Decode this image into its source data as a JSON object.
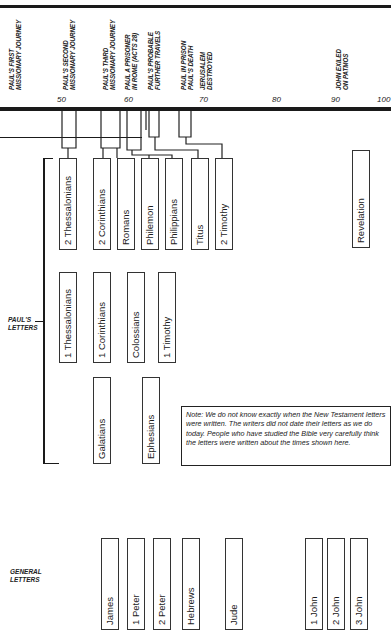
{
  "header": {
    "caption": ""
  },
  "timeline": {
    "ticks": [
      {
        "label": "50",
        "x": 62
      },
      {
        "label": "60",
        "x": 129
      },
      {
        "label": "70",
        "x": 204
      },
      {
        "label": "80",
        "x": 277
      },
      {
        "label": "90",
        "x": 336
      },
      {
        "label": "100",
        "x": 382
      }
    ],
    "events": [
      {
        "lines": [
          "PAUL'S FIRST",
          "MISSIONARY JOURNEY"
        ],
        "x": 9
      },
      {
        "lines": [
          "PAUL'S SECOND",
          "MISSIONARY JOURNEY"
        ],
        "x": 63
      },
      {
        "lines": [
          "PAUL'S THIRD",
          "MISSIONARY JOURNEY"
        ],
        "x": 103
      },
      {
        "lines": [
          "PAUL A PRISONER",
          "IN ROME (ACTS 28)"
        ],
        "x": 125
      },
      {
        "lines": [
          "PAUL'S PROBABLE",
          "FURTHER TRAVELS"
        ],
        "x": 148
      },
      {
        "lines": [
          "PAUL IN PRISON",
          "PAUL'S DEATH"
        ],
        "x": 181
      },
      {
        "lines": [
          "JERUSALEM",
          "DESTROYED"
        ],
        "x": 200
      },
      {
        "lines": [
          "JOHN EXILED",
          "ON PATMOS"
        ],
        "x": 336
      }
    ]
  },
  "groups": {
    "pauls_letters": {
      "line1": "PAUL'S",
      "line2": "LETTERS"
    },
    "general_letters": {
      "line1": "GENERAL",
      "line2": "LETTERS"
    }
  },
  "books": {
    "row1": [
      {
        "name": "2 Thessalonians",
        "x": 59,
        "y": 158,
        "h": 92
      },
      {
        "name": "2 Corinthians",
        "x": 93,
        "y": 158,
        "h": 92
      },
      {
        "name": "Romans",
        "x": 117,
        "y": 158,
        "h": 92
      },
      {
        "name": "Philemon",
        "x": 141,
        "y": 158,
        "h": 92
      },
      {
        "name": "Philippians",
        "x": 165,
        "y": 158,
        "h": 92
      },
      {
        "name": "Titus",
        "x": 191,
        "y": 158,
        "h": 92
      },
      {
        "name": "2 Timothy",
        "x": 215,
        "y": 158,
        "h": 92
      },
      {
        "name": "Revelation",
        "x": 352,
        "y": 150,
        "h": 98
      }
    ],
    "row2": [
      {
        "name": "1 Thessalonians",
        "x": 59,
        "y": 272,
        "h": 91
      },
      {
        "name": "1 Corinthians",
        "x": 93,
        "y": 272,
        "h": 91
      },
      {
        "name": "Colossians",
        "x": 127,
        "y": 272,
        "h": 91
      },
      {
        "name": "1 Timothy",
        "x": 158,
        "y": 272,
        "h": 91
      }
    ],
    "row3": [
      {
        "name": "Galatians",
        "x": 93,
        "y": 377,
        "h": 87
      },
      {
        "name": "Ephesians",
        "x": 142,
        "y": 377,
        "h": 87
      }
    ],
    "general": [
      {
        "name": "James",
        "x": 101,
        "y": 538,
        "h": 92
      },
      {
        "name": "1 Peter",
        "x": 127,
        "y": 538,
        "h": 92
      },
      {
        "name": "2 Peter",
        "x": 153,
        "y": 538,
        "h": 92
      },
      {
        "name": "Hebrews",
        "x": 182,
        "y": 538,
        "h": 92
      },
      {
        "name": "Jude",
        "x": 225,
        "y": 538,
        "h": 92
      },
      {
        "name": "1 John",
        "x": 305,
        "y": 538,
        "h": 92
      },
      {
        "name": "2 John",
        "x": 327,
        "y": 538,
        "h": 92
      },
      {
        "name": "3 John",
        "x": 350,
        "y": 538,
        "h": 92
      }
    ]
  },
  "note": {
    "text": "Note: We do not know exactly when the New Testament letters were written. The writers did not date their letters as we do today. People who have studied the Bible very carefully think the letters were written about the times shown here."
  }
}
